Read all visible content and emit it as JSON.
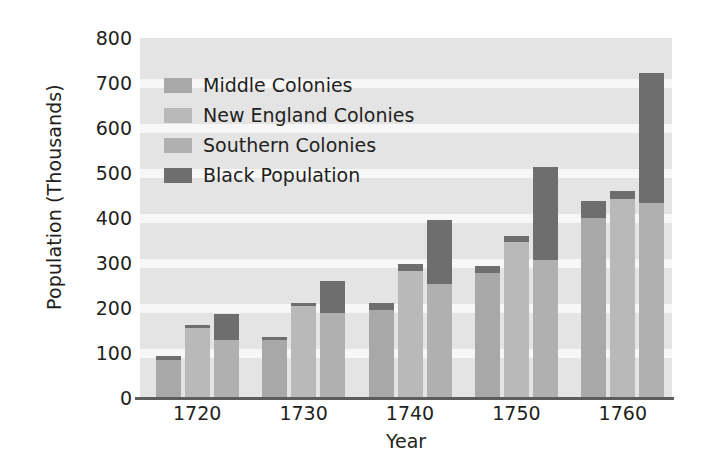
{
  "chart_data": {
    "type": "bar",
    "subtype": "grouped-stacked",
    "title": "",
    "xlabel": "Year",
    "ylabel": "Population (Thousands)",
    "ylim": [
      0,
      800
    ],
    "ytick_step": 100,
    "yticks": [
      "800",
      "700",
      "600",
      "500",
      "400",
      "300",
      "200",
      "100",
      "0"
    ],
    "grid": true,
    "grid_orientation": "horizontal",
    "legend_position": "upper-left",
    "categories": [
      "1720",
      "1730",
      "1740",
      "1750",
      "1760"
    ],
    "series": [
      {
        "name": "Middle Colonies",
        "color": "#a8a8a8",
        "values": [
          93,
          136,
          211,
          294,
          437
        ]
      },
      {
        "name": "New England Colonies",
        "color": "#b9b9b9",
        "values": [
          163,
          212,
          297,
          360,
          460
        ]
      },
      {
        "name": "Southern Colonies",
        "color": "#b0b0b0",
        "values": [
          186,
          261,
          396,
          514,
          723
        ]
      },
      {
        "name": "Black Population",
        "color": "#6e6e6e",
        "note": "dark segment drawn at the top of each colony bar; value is the base where the dark cap begins",
        "caps": {
          "Middle Colonies": [
            85,
            130,
            196,
            277,
            400
          ],
          "New England Colonies": [
            156,
            205,
            282,
            347,
            443
          ],
          "Southern Colonies": [
            130,
            190,
            253,
            307,
            433
          ]
        }
      }
    ]
  },
  "legend": {
    "items": [
      {
        "label": "Middle Colonies",
        "color": "#a8a8a8"
      },
      {
        "label": "New England Colonies",
        "color": "#b9b9b9"
      },
      {
        "label": "Southern Colonies",
        "color": "#b0b0b0"
      },
      {
        "label": "Black Population",
        "color": "#6e6e6e"
      }
    ]
  },
  "colors": {
    "plot_background": "#e4e4e4",
    "grid_band": "#f7f7f7",
    "axis": "#5d5d5d",
    "text": "#231f20",
    "page_background": "#ffffff"
  }
}
